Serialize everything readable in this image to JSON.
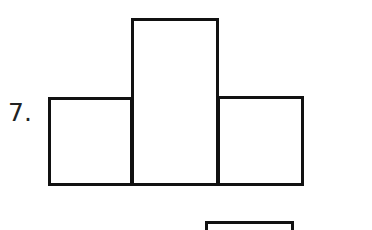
{
  "problem": {
    "number_label": "7.",
    "figure": {
      "description": "Composite figure of three adjacent rectangles: a taller middle rectangle flanked by two shorter rectangles of equal height",
      "shapes": [
        {
          "name": "left-rectangle",
          "x": 48,
          "y": 97,
          "w": 85,
          "h": 89
        },
        {
          "name": "middle-rectangle",
          "x": 131,
          "y": 18,
          "w": 88,
          "h": 168
        },
        {
          "name": "right-rectangle",
          "x": 217,
          "y": 96,
          "w": 87,
          "h": 90
        }
      ]
    },
    "next_figure_partial": {
      "x": 205,
      "y": 221,
      "w": 89,
      "h": 20
    }
  }
}
